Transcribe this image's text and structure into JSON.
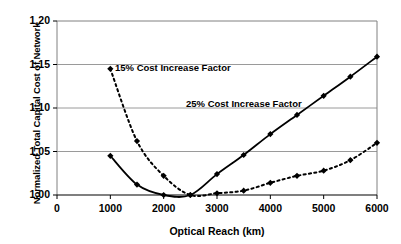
{
  "chart_data": {
    "type": "line",
    "title": "",
    "xlabel": "Optical Reach (km)",
    "ylabel": "Normalized Total Capital Cost of Network",
    "xlim": [
      0,
      6000
    ],
    "ylim": [
      1.0,
      1.2
    ],
    "xticks": [
      "0",
      "1000",
      "2000",
      "3000",
      "4000",
      "5000",
      "6000"
    ],
    "xtick_values": [
      0,
      1000,
      2000,
      3000,
      4000,
      5000,
      6000
    ],
    "yticks": [
      "1.00",
      "1.05",
      "1.10",
      "1.15",
      "1.20"
    ],
    "ytick_values": [
      1.0,
      1.05,
      1.1,
      1.15,
      1.2
    ],
    "grid": "horizontal",
    "legend_position": "inline-annotations",
    "series": [
      {
        "name": "15% Cost Increase Factor",
        "style": "dashed",
        "marker": "diamond",
        "color": "#000000",
        "x": [
          1000,
          1500,
          2000,
          2500,
          3000,
          3500,
          4000,
          4500,
          5000,
          5500,
          6000
        ],
        "values": [
          1.145,
          1.062,
          1.022,
          1.0,
          1.002,
          1.005,
          1.014,
          1.022,
          1.028,
          1.04,
          1.06
        ]
      },
      {
        "name": "25% Cost Increase Factor",
        "style": "solid",
        "marker": "diamond",
        "color": "#000000",
        "x": [
          1000,
          1500,
          2000,
          2500,
          3000,
          3500,
          4000,
          4500,
          5000,
          5500,
          6000
        ],
        "values": [
          1.045,
          1.012,
          1.0,
          1.0,
          1.024,
          1.046,
          1.07,
          1.092,
          1.114,
          1.136,
          1.159
        ]
      }
    ],
    "annotations": [
      {
        "text": "15% Cost Increase Factor",
        "x_px": 115,
        "y_px": 62
      },
      {
        "text": "25% Cost Increase Factor",
        "x_px": 186,
        "y_px": 98
      }
    ]
  },
  "axes": {
    "plot_left_px": 57,
    "plot_right_px": 377,
    "plot_top_px": 21,
    "plot_bottom_px": 195
  }
}
